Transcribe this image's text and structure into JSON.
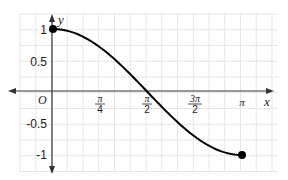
{
  "chart_data": {
    "type": "line",
    "title": "",
    "xlabel": "x",
    "ylabel": "y",
    "function": "y = cos(x)",
    "domain": [
      0,
      3.14159
    ],
    "xlim": [
      0,
      3.14159
    ],
    "ylim": [
      -1,
      1
    ],
    "grid": true,
    "origin_label": "O",
    "x_ticks": [
      {
        "value": 0.7854,
        "label_num": "π",
        "label_den": "4"
      },
      {
        "value": 1.5708,
        "label_num": "π",
        "label_den": "2"
      },
      {
        "value": 2.3562,
        "label_num": "3π",
        "label_den": "2"
      },
      {
        "value": 3.14159,
        "label": "π"
      }
    ],
    "y_ticks": [
      {
        "value": 1,
        "label": "1"
      },
      {
        "value": 0.5,
        "label": "0.5"
      },
      {
        "value": -0.5,
        "label": "-0.5"
      },
      {
        "value": -1,
        "label": "-1"
      }
    ],
    "series": [
      {
        "name": "cos x",
        "x": [
          0,
          0.3927,
          0.7854,
          1.1781,
          1.5708,
          1.9635,
          2.3562,
          2.7489,
          3.14159
        ],
        "y": [
          1,
          0.924,
          0.707,
          0.383,
          0,
          -0.383,
          -0.707,
          -0.924,
          -1
        ],
        "endpoints": [
          {
            "x": 0,
            "y": 1,
            "closed": true
          },
          {
            "x": 3.14159,
            "y": -1,
            "closed": true
          }
        ]
      }
    ],
    "colors": {
      "curve": "#000000",
      "grid": "#e4e4e4",
      "axis": "#333333"
    }
  }
}
